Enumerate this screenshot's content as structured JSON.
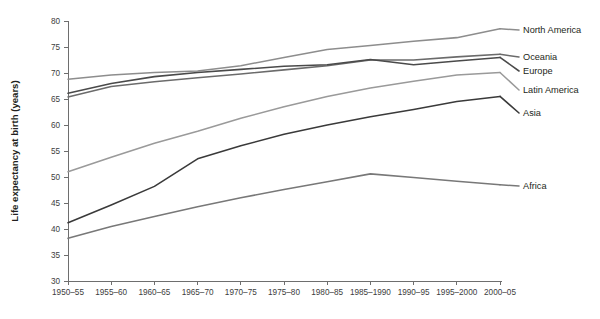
{
  "chart_data": {
    "type": "line",
    "title": "",
    "xlabel": "",
    "ylabel": "Life expectancy at birth (years)",
    "ylim": [
      30,
      80
    ],
    "ytick_step": 5,
    "yticks": [
      30,
      35,
      40,
      45,
      50,
      55,
      60,
      65,
      70,
      75,
      80
    ],
    "grid": false,
    "legend_position": "right-inline-labels",
    "categories": [
      "1950–55",
      "1955–60",
      "1960–65",
      "1965–70",
      "1970–75",
      "1975–80",
      "1980–85",
      "1985–1990",
      "1990–95",
      "1995–2000",
      "2000–05"
    ],
    "series": [
      {
        "name": "North America",
        "color": "#8d8d8d",
        "values": [
          68.8,
          69.6,
          70.1,
          70.4,
          71.4,
          73.0,
          74.5,
          75.3,
          76.1,
          76.8,
          78.5
        ]
      },
      {
        "name": "Oceania",
        "color": "#6b6b6b",
        "values": [
          65.4,
          67.4,
          68.3,
          69.1,
          69.8,
          70.6,
          71.4,
          72.5,
          72.5,
          73.1,
          73.6
        ]
      },
      {
        "name": "Europe",
        "color": "#4a4a4a",
        "values": [
          66.1,
          68.0,
          69.3,
          70.1,
          70.7,
          71.3,
          71.6,
          72.6,
          71.6,
          72.3,
          73.0
        ]
      },
      {
        "name": "Latin America",
        "color": "#9a9a9a",
        "values": [
          51.0,
          53.8,
          56.5,
          58.8,
          61.3,
          63.5,
          65.5,
          67.1,
          68.4,
          69.6,
          70.1
        ]
      },
      {
        "name": "Asia",
        "color": "#3a3a3a",
        "values": [
          41.2,
          44.6,
          48.2,
          53.5,
          56.0,
          58.2,
          60.0,
          61.6,
          63.0,
          64.5,
          65.5
        ]
      },
      {
        "name": "Africa",
        "color": "#787878",
        "values": [
          38.2,
          40.5,
          42.4,
          44.3,
          46.0,
          47.6,
          49.1,
          50.6,
          49.9,
          49.2,
          48.5
        ]
      }
    ]
  },
  "plot_geometry": {
    "left": 68,
    "right": 500,
    "top": 21,
    "bottom": 281,
    "label_x": 523,
    "label_anchor_offsets": {
      "North America": 30,
      "Oceania": 57,
      "Europe": 71,
      "Latin America": 90,
      "Asia": 113,
      "Africa": 186
    }
  }
}
